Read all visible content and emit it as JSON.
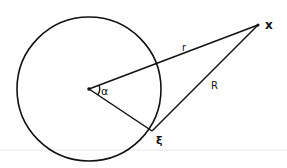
{
  "diagram": {
    "labels": {
      "x_point": "x",
      "r_segment": "r",
      "R_segment": "R",
      "angle": "α",
      "xi_point": "ξ"
    },
    "colors": {
      "stroke": "#111111",
      "background": "#ffffff",
      "divider": "#e6e6e6"
    }
  }
}
